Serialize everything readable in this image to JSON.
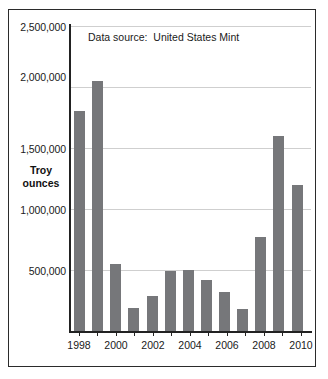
{
  "annotation": {
    "text": "Data source:  United States Mint"
  },
  "axis": {
    "y_title_line1": "Troy",
    "y_title_line2": "ounces",
    "y_ticks": [
      "2,500,000",
      "2,000,000",
      "1,500,000",
      "1,000,000",
      "500,000"
    ],
    "x_ticks": [
      "1998",
      "2000",
      "2002",
      "2004",
      "2006",
      "2008",
      "2010"
    ]
  },
  "colors": {
    "bar": "#76777a",
    "gridline": "#cfcfcf",
    "axis": "#222222",
    "frame": "#2b2b2b",
    "text": "#1a1a1a",
    "background": "#ffffff"
  },
  "chart_data": {
    "type": "bar",
    "title": "",
    "subtitle": "",
    "xlabel": "",
    "ylabel": "Troy ounces",
    "annotations": [
      "Data source:  United States Mint"
    ],
    "grid": true,
    "legend": "none",
    "ylim": [
      0,
      2500000
    ],
    "ytick_values": [
      500000,
      1000000,
      1500000,
      2000000,
      2500000
    ],
    "xtick_labels": [
      "1998",
      "2000",
      "2002",
      "2004",
      "2006",
      "2008",
      "2010"
    ],
    "categories": [
      "1998",
      "1999",
      "2000",
      "2001",
      "2002",
      "2003",
      "2004",
      "2005",
      "2006",
      "2007",
      "2008",
      "2009",
      "2010"
    ],
    "values": [
      1800000,
      2050000,
      550000,
      190000,
      290000,
      490000,
      500000,
      420000,
      320000,
      180000,
      770000,
      1600000,
      1200000
    ],
    "series": [
      {
        "name": "Troy ounces",
        "values": [
          1800000,
          2050000,
          550000,
          190000,
          290000,
          490000,
          500000,
          420000,
          320000,
          180000,
          770000,
          1600000,
          1200000
        ]
      }
    ]
  }
}
